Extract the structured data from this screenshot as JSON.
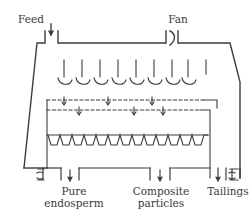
{
  "figure": {
    "line_color": "#3c3c3c",
    "labels": {
      "feed": "Feed",
      "fan": "Fan",
      "pure_endosperm_line1": "Pure",
      "pure_endosperm_line2": "endosperm",
      "composite_line1": "Composite",
      "composite_line2": "particles",
      "tailings": "Tailings"
    },
    "components": {
      "air_valves_count": 8,
      "sieve_layers": 2,
      "collection_hoppers": 12
    }
  }
}
